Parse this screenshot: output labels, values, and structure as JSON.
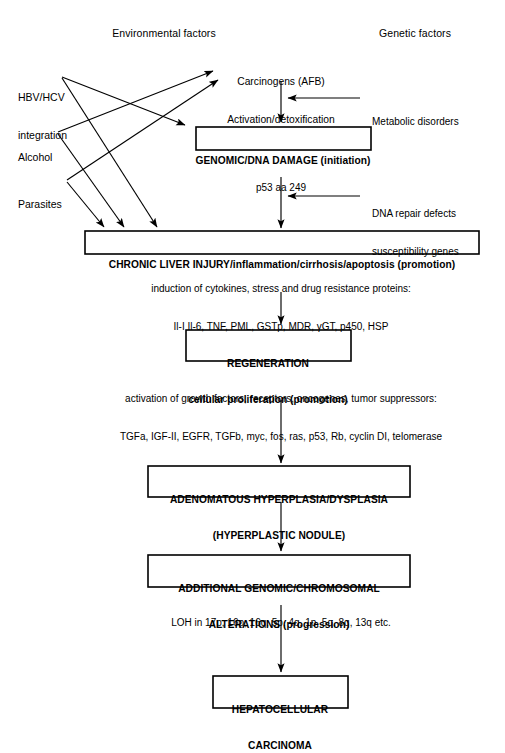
{
  "figure": {
    "type": "flowchart",
    "headers": {
      "left": "Environmental factors",
      "right": "Genetic factors"
    },
    "sources": [
      {
        "id": "hbv",
        "label_line1": "HBV/HCV",
        "label_line2": "integration"
      },
      {
        "id": "alcohol",
        "label_line1": "Alcohol",
        "label_line2": ""
      },
      {
        "id": "parasites",
        "label_line1": "Parasites",
        "label_line2": ""
      }
    ],
    "carcinogens": {
      "line1": "Carcinogens (AFB)",
      "line2": "Activation/detoxification"
    },
    "side_inputs": [
      {
        "id": "metabolic",
        "line1": "Metabolic disorders",
        "line2": ""
      },
      {
        "id": "dna-repair",
        "line1": "DNA repair defects",
        "line2": "susceptibility genes"
      }
    ],
    "nodes": [
      {
        "id": "genomic-damage",
        "line1": "GENOMIC/DNA DAMAGE (initiation)",
        "line2": ""
      },
      {
        "id": "chronic-liver-injury",
        "line1": "CHRONIC LIVER INJURY/inflammation/cirrhosis/apoptosis (promotion)",
        "line2": ""
      },
      {
        "id": "regeneration",
        "line1": "REGENERATION",
        "line2": "cellular proliferation (promotion)"
      },
      {
        "id": "adenomatous-hyperplasia",
        "line1": "ADENOMATOUS HYPERPLASIA/DYSPLASIA",
        "line2": "(HYPERPLASTIC NODULE)"
      },
      {
        "id": "additional-alterations",
        "line1": "ADDITIONAL GENOMIC/CHROMOSOMAL",
        "line2": "ALTERATIONS (progression)"
      },
      {
        "id": "hepatocellular-carcinoma",
        "line1": "HEPATOCELLULAR",
        "line2": "CARCINOMA"
      }
    ],
    "annotations": [
      {
        "id": "p53",
        "line1": "p53 aa 249",
        "line2": ""
      },
      {
        "id": "cytokines",
        "line1": "induction of cytokines, stress and drug resistance proteins:",
        "line2": "Il-I Il-6, TNF, PML, GSTp, MDR, γGT, p450, HSP"
      },
      {
        "id": "growth-factors",
        "line1": "activation of growth factors, receptors, oncogenes, tumor suppressors:",
        "line2": "TGFa, IGF-II, EGFR, TGFb, myc, fos, ras, p53, Rb, cyclin DI, telomerase"
      },
      {
        "id": "loh",
        "line1": "LOH in 17p, 16p, 16q, 5p, 4q, 1p, 5q, 8q, 13q etc.",
        "line2": ""
      }
    ],
    "colors": {
      "background": "#ffffff",
      "stroke": "#000000",
      "text": "#000000"
    }
  }
}
